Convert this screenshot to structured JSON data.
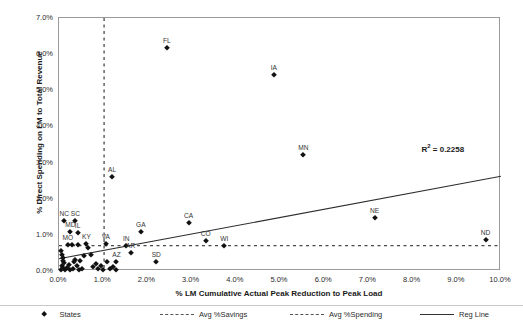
{
  "chart_data": {
    "type": "scatter",
    "title": "",
    "xlabel": "% LM Cumulative Actual Peak Reduction to Peak Load",
    "ylabel": "% Direct Spending on LM to Total Revenue",
    "xlim": [
      0.0,
      10.0
    ],
    "ylim": [
      0.0,
      7.0
    ],
    "xticks": [
      "0.0%",
      "1.0%",
      "2.0%",
      "3.0%",
      "4.0%",
      "5.0%",
      "6.0%",
      "7.0%",
      "8.0%",
      "9.0%",
      "10.0%"
    ],
    "yticks": [
      "0.0%",
      "1.0%",
      "2.0%",
      "3.0%",
      "4.0%",
      "5.0%",
      "6.0%",
      "7.0%"
    ],
    "xtick_values": [
      0.0,
      1.0,
      2.0,
      3.0,
      4.0,
      5.0,
      6.0,
      7.0,
      8.0,
      9.0,
      10.0
    ],
    "ytick_values": [
      0.0,
      1.0,
      2.0,
      3.0,
      4.0,
      5.0,
      6.0,
      7.0
    ],
    "grid": false,
    "legend_position": "bottom",
    "annotations": [
      {
        "text": "R² = 0.2258",
        "r2_value": 0.2258,
        "x": 8.2,
        "y": 3.55
      }
    ],
    "reference_lines": [
      {
        "name": "Avg %Savings",
        "orientation": "vertical",
        "value": 1.02,
        "style": "dashed"
      },
      {
        "name": "Avg %Spending",
        "orientation": "horizontal",
        "value": 0.7,
        "style": "dashed"
      }
    ],
    "trendline": {
      "name": "Reg Line",
      "style": "solid",
      "x_start": 0.0,
      "y_start": 0.34,
      "x_end": 10.0,
      "y_end": 2.62
    },
    "series": [
      {
        "name": "States",
        "marker": "diamond",
        "color": "#111111",
        "points": [
          {
            "label": "FL",
            "x": 2.44,
            "y": 6.18
          },
          {
            "label": "IA",
            "x": 4.86,
            "y": 5.42
          },
          {
            "label": "MN",
            "x": 5.53,
            "y": 3.2
          },
          {
            "label": "AL",
            "x": 1.2,
            "y": 2.6
          },
          {
            "label": "NC",
            "x": 0.12,
            "y": 1.39
          },
          {
            "label": "SC",
            "x": 0.37,
            "y": 1.38
          },
          {
            "label": "CA",
            "x": 2.93,
            "y": 1.33
          },
          {
            "label": "NE",
            "x": 7.14,
            "y": 1.48
          },
          {
            "label": "MD",
            "x": 0.26,
            "y": 1.09
          },
          {
            "label": "IL",
            "x": 0.42,
            "y": 1.06
          },
          {
            "label": "GA",
            "x": 1.85,
            "y": 1.08
          },
          {
            "label": "ND",
            "x": 9.65,
            "y": 0.86
          },
          {
            "label": "CO",
            "x": 3.32,
            "y": 0.83
          },
          {
            "label": "MO",
            "x": 0.2,
            "y": 0.73
          },
          {
            "label": "KY",
            "x": 0.62,
            "y": 0.75
          },
          {
            "label": "VA",
            "x": 1.06,
            "y": 0.75
          },
          {
            "label": "IN",
            "x": 1.52,
            "y": 0.7
          },
          {
            "label": "WI",
            "x": 3.74,
            "y": 0.69
          },
          {
            "label": "AR",
            "x": 1.62,
            "y": 0.5
          },
          {
            "label": "SD",
            "x": 2.2,
            "y": 0.26
          },
          {
            "label": "AZ",
            "x": 1.3,
            "y": 0.26
          },
          {
            "label": "",
            "x": 0.05,
            "y": 0.56
          },
          {
            "label": "",
            "x": 0.07,
            "y": 0.45
          },
          {
            "label": "",
            "x": 0.08,
            "y": 0.36
          },
          {
            "label": "",
            "x": 0.1,
            "y": 0.29
          },
          {
            "label": "",
            "x": 0.12,
            "y": 0.22
          },
          {
            "label": "",
            "x": 0.06,
            "y": 0.15
          },
          {
            "label": "",
            "x": 0.09,
            "y": 0.08
          },
          {
            "label": "",
            "x": 0.04,
            "y": 0.04
          },
          {
            "label": "",
            "x": 0.14,
            "y": 0.03
          },
          {
            "label": "",
            "x": 0.18,
            "y": 0.09
          },
          {
            "label": "",
            "x": 0.22,
            "y": 0.17
          },
          {
            "label": "",
            "x": 0.26,
            "y": 0.03
          },
          {
            "label": "",
            "x": 0.31,
            "y": 0.05
          },
          {
            "label": "",
            "x": 0.33,
            "y": 0.25
          },
          {
            "label": "",
            "x": 0.37,
            "y": 0.3
          },
          {
            "label": "",
            "x": 0.41,
            "y": 0.13
          },
          {
            "label": "",
            "x": 0.45,
            "y": 0.04
          },
          {
            "label": "",
            "x": 0.48,
            "y": 0.27
          },
          {
            "label": "",
            "x": 0.52,
            "y": 0.06
          },
          {
            "label": "",
            "x": 0.3,
            "y": 0.72
          },
          {
            "label": "",
            "x": 0.44,
            "y": 0.71
          },
          {
            "label": "",
            "x": 0.56,
            "y": 0.42
          },
          {
            "label": "",
            "x": 0.72,
            "y": 0.44
          },
          {
            "label": "",
            "x": 0.78,
            "y": 0.12
          },
          {
            "label": "",
            "x": 0.84,
            "y": 0.18
          },
          {
            "label": "",
            "x": 0.88,
            "y": 0.05
          },
          {
            "label": "",
            "x": 0.94,
            "y": 0.14
          },
          {
            "label": "",
            "x": 1.0,
            "y": 0.04
          },
          {
            "label": "",
            "x": 1.08,
            "y": 0.24
          },
          {
            "label": "",
            "x": 1.16,
            "y": 0.05
          },
          {
            "label": "",
            "x": 1.22,
            "y": 0.1
          },
          {
            "label": "",
            "x": 1.28,
            "y": 0.04
          },
          {
            "label": "",
            "x": 0.66,
            "y": 0.64
          }
        ]
      }
    ]
  },
  "legend": {
    "items": [
      {
        "label": "States",
        "style": "marker"
      },
      {
        "label": "Avg %Savings",
        "style": "dashed"
      },
      {
        "label": "Avg %Spending",
        "style": "dashed"
      },
      {
        "label": "Reg Line",
        "style": "solid"
      }
    ]
  }
}
